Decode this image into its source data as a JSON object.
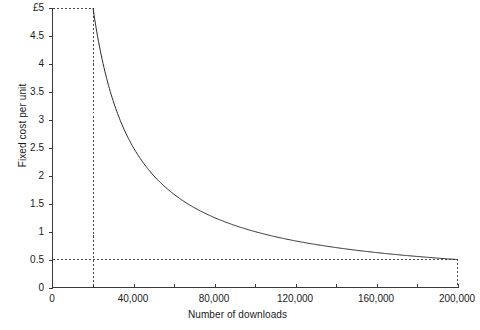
{
  "chart_data": {
    "type": "line",
    "title": "",
    "xlabel": "Number of downloads",
    "ylabel": "Fixed cost per unit",
    "xlim": [
      0,
      200000
    ],
    "ylim": [
      0,
      5
    ],
    "grid": false,
    "legend": null,
    "curve_formula": "y = 100000 / x",
    "x_tick_labels": [
      "0",
      "40,000",
      "80,000",
      "120,000",
      "160,000",
      "200,000"
    ],
    "x_tick_values": [
      0,
      40000,
      80000,
      120000,
      160000,
      200000
    ],
    "x_minor_tick_values": [
      20000,
      60000,
      100000,
      140000,
      180000
    ],
    "y_tick_labels": [
      "0",
      "0.5",
      "1",
      "1.5",
      "2",
      "2.5",
      "3",
      "3.5",
      "4",
      "4.5",
      "£5"
    ],
    "y_tick_values": [
      0,
      0.5,
      1,
      1.5,
      2,
      2.5,
      3,
      3.5,
      4,
      4.5,
      5
    ],
    "x": [
      20000,
      25000,
      30000,
      35000,
      40000,
      45000,
      50000,
      60000,
      70000,
      80000,
      90000,
      100000,
      110000,
      120000,
      130000,
      140000,
      150000,
      160000,
      170000,
      180000,
      190000,
      200000
    ],
    "values": [
      5,
      4,
      3.333,
      2.857,
      2.5,
      2.222,
      2,
      1.667,
      1.429,
      1.25,
      1.111,
      1,
      0.909,
      0.833,
      0.769,
      0.714,
      0.667,
      0.625,
      0.588,
      0.556,
      0.526,
      0.5
    ],
    "guides": [
      {
        "name": "upper-guide",
        "x": 20000,
        "y": 5
      },
      {
        "name": "lower-guide",
        "x": 200000,
        "y": 0.5
      }
    ],
    "colors": {
      "curve": "#2b2b2b",
      "axis": "#3a3a3a",
      "guide": "#4a4a4a",
      "background": "#ffffff"
    }
  }
}
